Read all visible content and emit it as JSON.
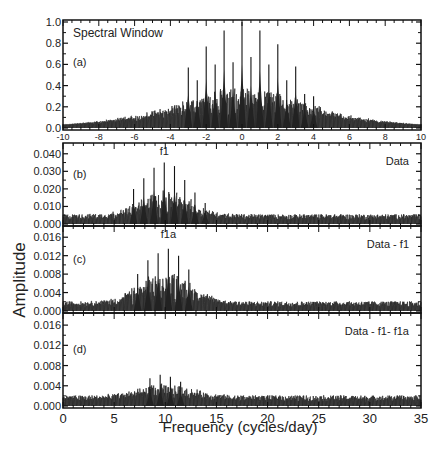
{
  "chart_data": {
    "type": "line",
    "figure_ylabel": "Amplitude",
    "figure_xlabel": "Frequency (cycles/day)",
    "panels": [
      {
        "id": "a",
        "label": "(a)",
        "title": "Spectral Window",
        "annotation": "",
        "xlim": [
          -10,
          10
        ],
        "x_ticks": [
          -10,
          -8,
          -6,
          -4,
          -2,
          0,
          2,
          4,
          6,
          8,
          10
        ],
        "ylim": [
          0.0,
          1.0
        ],
        "y_ticks": [
          "0.0",
          "0.2",
          "0.4",
          "0.6",
          "0.8",
          "1.0"
        ],
        "y_tick_values": [
          0.0,
          0.2,
          0.4,
          0.6,
          0.8,
          1.0
        ],
        "peaks": [
          {
            "x": -3,
            "y": 0.57
          },
          {
            "x": -2.5,
            "y": 0.45
          },
          {
            "x": -2,
            "y": 0.77
          },
          {
            "x": -1.5,
            "y": 0.6
          },
          {
            "x": -1,
            "y": 0.92
          },
          {
            "x": -0.5,
            "y": 0.62
          },
          {
            "x": 0,
            "y": 1.0
          },
          {
            "x": 0.5,
            "y": 0.67
          },
          {
            "x": 1,
            "y": 0.92
          },
          {
            "x": 1.5,
            "y": 0.6
          },
          {
            "x": 2,
            "y": 0.79
          },
          {
            "x": 2.5,
            "y": 0.45
          },
          {
            "x": 3,
            "y": 0.58
          },
          {
            "x": 3.5,
            "y": 0.32
          },
          {
            "x": 4,
            "y": 0.3
          }
        ],
        "envelope": {
          "center": 0,
          "width": 4.5,
          "base": 0.03,
          "noise": 0.12
        }
      },
      {
        "id": "b",
        "label": "(b)",
        "title": "",
        "annotation": "Data",
        "peak_label": "f1",
        "peak_label_x": 9.9,
        "xlim": [
          0,
          35
        ],
        "ylim": [
          0.0,
          0.045
        ],
        "y_ticks": [
          "0.000",
          "0.010",
          "0.020",
          "0.030",
          "0.040"
        ],
        "y_tick_values": [
          0.0,
          0.01,
          0.02,
          0.03,
          0.04
        ],
        "peaks": [
          {
            "x": 6.9,
            "y": 0.02
          },
          {
            "x": 7.9,
            "y": 0.026
          },
          {
            "x": 8.9,
            "y": 0.032
          },
          {
            "x": 9.9,
            "y": 0.035
          },
          {
            "x": 10.9,
            "y": 0.033
          },
          {
            "x": 11.9,
            "y": 0.025
          },
          {
            "x": 12.9,
            "y": 0.018
          },
          {
            "x": 13.9,
            "y": 0.012
          }
        ],
        "envelope": {
          "center": 10,
          "width": 3.6,
          "base": 0.004,
          "noise": 0.016
        }
      },
      {
        "id": "c",
        "label": "(c)",
        "title": "",
        "annotation": "Data - f1",
        "peak_label": "f1a",
        "peak_label_x": 10.3,
        "xlim": [
          0,
          35
        ],
        "ylim": [
          0.0,
          0.018
        ],
        "y_ticks": [
          "0.000",
          "0.004",
          "0.008",
          "0.012",
          "0.016"
        ],
        "y_tick_values": [
          0.0,
          0.004,
          0.008,
          0.012,
          0.016
        ],
        "peaks": [
          {
            "x": 7.3,
            "y": 0.008
          },
          {
            "x": 8.3,
            "y": 0.011
          },
          {
            "x": 9.3,
            "y": 0.0125
          },
          {
            "x": 10.3,
            "y": 0.0135
          },
          {
            "x": 11.3,
            "y": 0.012
          },
          {
            "x": 12.3,
            "y": 0.009
          }
        ],
        "envelope": {
          "center": 10,
          "width": 3.6,
          "base": 0.0015,
          "noise": 0.0075
        }
      },
      {
        "id": "d",
        "label": "(d)",
        "title": "",
        "annotation": "Data - f1- f1a",
        "xlim": [
          0,
          35
        ],
        "x_ticks": [
          0,
          5,
          10,
          15,
          20,
          25,
          30,
          35
        ],
        "ylim": [
          0.0,
          0.018
        ],
        "y_ticks": [
          "0.000",
          "0.004",
          "0.008",
          "0.012",
          "0.016"
        ],
        "y_tick_values": [
          0.0,
          0.004,
          0.008,
          0.012,
          0.016
        ],
        "peaks": [
          {
            "x": 8.5,
            "y": 0.0055
          },
          {
            "x": 9.5,
            "y": 0.0062
          },
          {
            "x": 10.5,
            "y": 0.0058
          },
          {
            "x": 11.5,
            "y": 0.0048
          }
        ],
        "envelope": {
          "center": 10,
          "width": 3.8,
          "base": 0.0015,
          "noise": 0.0028
        }
      }
    ]
  }
}
